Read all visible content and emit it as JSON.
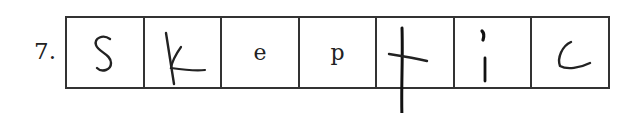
{
  "item": {
    "number": "7.",
    "word": "skeptic",
    "cells": [
      {
        "letter": "S",
        "style": "handwritten"
      },
      {
        "letter": "k",
        "style": "handwritten"
      },
      {
        "letter": "e",
        "style": "printed"
      },
      {
        "letter": "p",
        "style": "printed"
      },
      {
        "letter": "t",
        "style": "handwritten"
      },
      {
        "letter": "i",
        "style": "handwritten"
      },
      {
        "letter": "c",
        "style": "handwritten"
      }
    ]
  }
}
